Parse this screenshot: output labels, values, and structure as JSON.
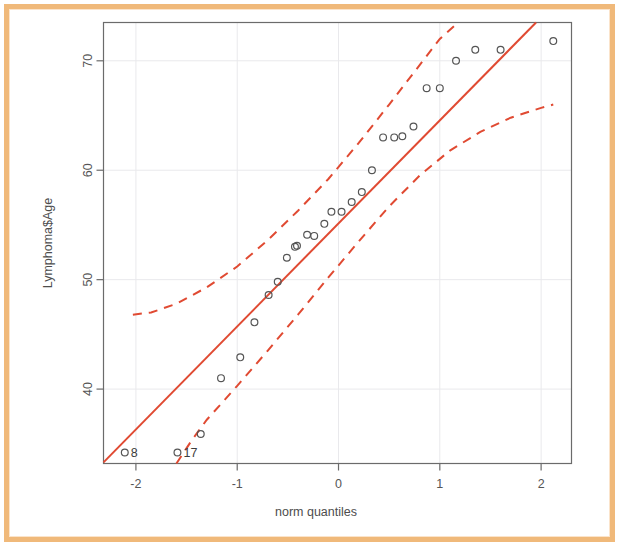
{
  "chart_data": {
    "type": "scatter",
    "title": "",
    "xlabel": "norm quantiles",
    "ylabel": "Lymphoma$Age",
    "xlim": [
      -2.32,
      2.3
    ],
    "ylim": [
      33.2,
      73.5
    ],
    "xticks": [
      -2,
      -1,
      0,
      1,
      2
    ],
    "xticklabels": [
      "-2",
      "-1",
      "0",
      "1",
      "2"
    ],
    "yticks": [
      40,
      50,
      60,
      70
    ],
    "yticklabels": [
      "40",
      "50",
      "60",
      "70"
    ],
    "grid": true,
    "legend": null,
    "point_color": "#555555",
    "line_color": "#e04a32",
    "band_color": "#e04a32",
    "point_marker": "open-circle",
    "points": [
      {
        "x": -2.11,
        "y": 34.2,
        "label": "8"
      },
      {
        "x": -1.59,
        "y": 34.2,
        "label": "17"
      },
      {
        "x": -1.36,
        "y": 35.9,
        "label": ""
      },
      {
        "x": -1.16,
        "y": 41.0,
        "label": ""
      },
      {
        "x": -0.97,
        "y": 42.9,
        "label": ""
      },
      {
        "x": -0.83,
        "y": 46.1,
        "label": ""
      },
      {
        "x": -0.69,
        "y": 48.6,
        "label": ""
      },
      {
        "x": -0.6,
        "y": 49.8,
        "label": ""
      },
      {
        "x": -0.51,
        "y": 52.0,
        "label": ""
      },
      {
        "x": -0.43,
        "y": 53.0,
        "label": ""
      },
      {
        "x": -0.41,
        "y": 53.1,
        "label": ""
      },
      {
        "x": -0.31,
        "y": 54.1,
        "label": ""
      },
      {
        "x": -0.24,
        "y": 54.0,
        "label": ""
      },
      {
        "x": -0.14,
        "y": 55.1,
        "label": ""
      },
      {
        "x": -0.07,
        "y": 56.2,
        "label": ""
      },
      {
        "x": 0.03,
        "y": 56.2,
        "label": ""
      },
      {
        "x": 0.13,
        "y": 57.1,
        "label": ""
      },
      {
        "x": 0.23,
        "y": 58.0,
        "label": ""
      },
      {
        "x": 0.33,
        "y": 60.0,
        "label": ""
      },
      {
        "x": 0.44,
        "y": 63.0,
        "label": ""
      },
      {
        "x": 0.55,
        "y": 63.0,
        "label": ""
      },
      {
        "x": 0.63,
        "y": 63.1,
        "label": ""
      },
      {
        "x": 0.74,
        "y": 64.0,
        "label": ""
      },
      {
        "x": 0.87,
        "y": 67.5,
        "label": ""
      },
      {
        "x": 1.0,
        "y": 67.5,
        "label": ""
      },
      {
        "x": 1.16,
        "y": 70.0,
        "label": ""
      },
      {
        "x": 1.35,
        "y": 71.0,
        "label": ""
      },
      {
        "x": 1.6,
        "y": 71.0,
        "label": ""
      },
      {
        "x": 2.12,
        "y": 71.8,
        "label": ""
      }
    ],
    "fit_line": {
      "name": "qq reference line",
      "x": [
        -2.32,
        1.95
      ],
      "y": [
        33.3,
        73.5
      ],
      "style": "solid"
    },
    "upper_band": {
      "name": "upper confidence envelope",
      "style": "dashed",
      "x": [
        -2.03,
        -1.85,
        -1.6,
        -1.3,
        -1.0,
        -0.7,
        -0.4,
        -0.1,
        0.2,
        0.5,
        0.75,
        1.0,
        1.18
      ],
      "y": [
        46.8,
        47.0,
        47.8,
        49.3,
        51.2,
        53.6,
        56.3,
        59.2,
        62.5,
        66.0,
        69.0,
        72.0,
        73.5
      ]
    },
    "lower_band": {
      "name": "lower confidence envelope",
      "style": "dashed",
      "x": [
        -1.6,
        -1.45,
        -1.3,
        -1.0,
        -0.7,
        -0.4,
        -0.1,
        0.2,
        0.5,
        0.8,
        1.1,
        1.4,
        1.7,
        2.0,
        2.12
      ],
      "y": [
        33.2,
        35.3,
        37.2,
        40.3,
        43.5,
        46.8,
        50.2,
        53.5,
        56.7,
        59.5,
        61.8,
        63.5,
        64.8,
        65.7,
        66.0
      ]
    }
  },
  "figure": {
    "border_color": "#f0b97a",
    "background": "#ffffff"
  }
}
